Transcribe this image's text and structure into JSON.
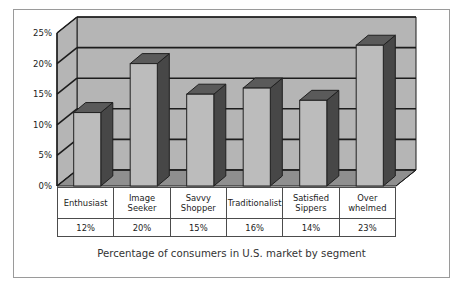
{
  "figure": {
    "caption": "Percentage of consumers in U.S. market by segment",
    "border_color": "#9a9a9a",
    "background": "#ffffff"
  },
  "colors": {
    "back_wall": "#b5b5b5",
    "floor": "#8f8f8f",
    "bar_front": "#bcbcbc",
    "bar_side": "#474747",
    "bar_top": "#5a5a5a",
    "gridline": "#1c1c1c",
    "axis": "#1c1c1c",
    "text": "#1c1c1c"
  },
  "chart_data": {
    "type": "bar",
    "title": "",
    "subtitle": "",
    "caption": "Percentage of consumers in U.S. market by segment",
    "xlabel": "",
    "ylabel": "",
    "categories": [
      "Enthusiast",
      "Image Seeker",
      "Savvy Shopper",
      "Traditionalist",
      "Satisfied Sippers",
      "Over whelmed"
    ],
    "values": [
      12,
      20,
      15,
      16,
      14,
      23
    ],
    "value_labels": [
      "12%",
      "20%",
      "15%",
      "16%",
      "14%",
      "23%"
    ],
    "ylim": [
      0,
      25
    ],
    "yticks": [
      0,
      5,
      10,
      15,
      20,
      25
    ],
    "ytick_labels": [
      "0%",
      "5%",
      "10%",
      "15%",
      "20%",
      "25%"
    ],
    "grid": true,
    "grid_axis": "y",
    "legend": "none",
    "style": "3d-column"
  },
  "category_lines": [
    [
      "Enthusiast",
      ""
    ],
    [
      "Image",
      "Seeker"
    ],
    [
      "Savvy",
      "Shopper"
    ],
    [
      "Traditionalist",
      ""
    ],
    [
      "Satisfied",
      "Sippers"
    ],
    [
      "Over",
      "whelmed"
    ]
  ],
  "axis": {
    "ticks": [
      {
        "label": "25%"
      },
      {
        "label": "20%"
      },
      {
        "label": "15%"
      },
      {
        "label": "10%"
      },
      {
        "label": "5%"
      },
      {
        "label": "0%"
      }
    ]
  }
}
